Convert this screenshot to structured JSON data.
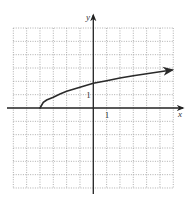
{
  "chart_data": {
    "type": "line",
    "title": "",
    "xlabel": "x",
    "ylabel": "y",
    "xlim": [
      -6,
      6
    ],
    "ylim": [
      -6,
      6
    ],
    "grid": true,
    "grid_style": "dotted",
    "tick_labels": [
      {
        "axis": "x",
        "value": 1,
        "text": "1"
      },
      {
        "axis": "y",
        "value": 1,
        "text": "1"
      }
    ],
    "series": [
      {
        "name": "f(x)",
        "description": "square-root curve starting at (-4, 0), arrow pointing right",
        "start_point": [
          -4,
          0
        ],
        "end_arrow": true,
        "x": [
          -4,
          -3.75,
          -3.5,
          -3,
          -2.5,
          -2,
          -1,
          0,
          1,
          2,
          3,
          4,
          5,
          5.9
        ],
        "y": [
          0,
          0.42,
          0.6,
          0.8,
          1.05,
          1.25,
          1.55,
          1.85,
          2.05,
          2.25,
          2.42,
          2.57,
          2.72,
          2.85
        ]
      }
    ],
    "colors": {
      "curve": "#2a2a2a",
      "axes": "#222222",
      "grid": "#9a9a9a",
      "background": "#ffffff"
    }
  },
  "labels": {
    "x_axis": "x",
    "y_axis": "y",
    "x_tick_one": "1",
    "y_tick_one": "1"
  }
}
